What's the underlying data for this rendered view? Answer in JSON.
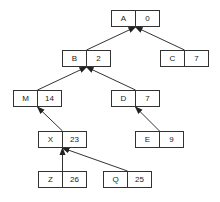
{
  "diagram": {
    "type": "parent-pointer tree",
    "nodes": [
      {
        "id": "A",
        "label": "A",
        "value": "0",
        "x": 111,
        "y": 10
      },
      {
        "id": "B",
        "label": "B",
        "value": "2",
        "x": 62,
        "y": 50
      },
      {
        "id": "C",
        "label": "C",
        "value": "7",
        "x": 160,
        "y": 50
      },
      {
        "id": "M",
        "label": "M",
        "value": "14",
        "x": 13,
        "y": 90
      },
      {
        "id": "D",
        "label": "D",
        "value": "7",
        "x": 111,
        "y": 90
      },
      {
        "id": "X",
        "label": "X",
        "value": "23",
        "x": 38,
        "y": 131
      },
      {
        "id": "E",
        "label": "E",
        "value": "9",
        "x": 135,
        "y": 131
      },
      {
        "id": "Z",
        "label": "Z",
        "value": "26",
        "x": 38,
        "y": 171
      },
      {
        "id": "Q",
        "label": "Q",
        "value": "25",
        "x": 103,
        "y": 171
      }
    ],
    "edges": [
      {
        "from": "B",
        "to": "A"
      },
      {
        "from": "C",
        "to": "A"
      },
      {
        "from": "M",
        "to": "B"
      },
      {
        "from": "D",
        "to": "B"
      },
      {
        "from": "X",
        "to": "M"
      },
      {
        "from": "E",
        "to": "D"
      },
      {
        "from": "Z",
        "to": "X"
      },
      {
        "from": "Q",
        "to": "X"
      }
    ],
    "colors": {
      "stroke": "#333333",
      "text": "#222222",
      "background": "#ffffff"
    }
  }
}
